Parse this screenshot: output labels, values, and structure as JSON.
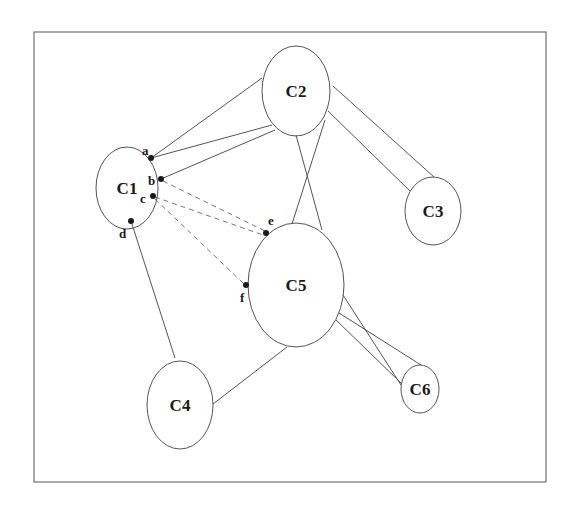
{
  "diagram": {
    "frame": {
      "x": 34,
      "y": 32,
      "width": 512,
      "height": 450
    },
    "colors": {
      "stroke": "#555555",
      "text": "#1a1a1a",
      "dashed": "#777777",
      "background": "#ffffff"
    },
    "nodes": [
      {
        "id": "C1",
        "label": "C1",
        "cx": 127,
        "cy": 188,
        "rx": 31,
        "ry": 41
      },
      {
        "id": "C2",
        "label": "C2",
        "cx": 296,
        "cy": 91,
        "rx": 34,
        "ry": 45
      },
      {
        "id": "C3",
        "label": "C3",
        "cx": 433,
        "cy": 211,
        "rx": 28,
        "ry": 34
      },
      {
        "id": "C4",
        "label": "C4",
        "cx": 180,
        "cy": 405,
        "rx": 33,
        "ry": 44
      },
      {
        "id": "C5",
        "label": "C5",
        "cx": 296,
        "cy": 285,
        "rx": 48,
        "ry": 62
      },
      {
        "id": "C6",
        "label": "C6",
        "cx": 420,
        "cy": 389,
        "rx": 19,
        "ry": 24
      }
    ],
    "points": [
      {
        "id": "a",
        "label": "a",
        "x": 151,
        "y": 158,
        "lx": 142,
        "ly": 155
      },
      {
        "id": "b",
        "label": "b",
        "x": 161,
        "y": 179,
        "lx": 148,
        "ly": 185
      },
      {
        "id": "c",
        "label": "c",
        "x": 153,
        "y": 196,
        "lx": 140,
        "ly": 203
      },
      {
        "id": "d",
        "label": "d",
        "x": 131,
        "y": 221,
        "lx": 119,
        "ly": 238
      },
      {
        "id": "e",
        "label": "e",
        "x": 266,
        "y": 233,
        "lx": 268,
        "ly": 225
      },
      {
        "id": "f",
        "label": "f",
        "x": 246,
        "y": 285,
        "lx": 240,
        "ly": 302
      }
    ],
    "edges": [
      {
        "from": "a",
        "x1": 151,
        "y1": 158,
        "x2": 262,
        "y2": 78,
        "style": "solid"
      },
      {
        "from": "a",
        "x1": 151,
        "y1": 158,
        "x2": 272,
        "y2": 125,
        "style": "solid"
      },
      {
        "from": "b",
        "x1": 161,
        "y1": 179,
        "x2": 275,
        "y2": 130,
        "style": "solid"
      },
      {
        "from": "C2",
        "x1": 333,
        "y1": 86,
        "x2": 434,
        "y2": 177,
        "style": "solid"
      },
      {
        "from": "C2",
        "x1": 328,
        "y1": 111,
        "x2": 410,
        "y2": 191,
        "style": "solid"
      },
      {
        "from": "C2",
        "x1": 296,
        "y1": 135,
        "x2": 322,
        "y2": 230,
        "style": "solid"
      },
      {
        "from": "C2",
        "x1": 325,
        "y1": 120,
        "x2": 292,
        "y2": 224,
        "style": "solid"
      },
      {
        "from": "d",
        "x1": 131,
        "y1": 221,
        "x2": 175,
        "y2": 358,
        "style": "solid"
      },
      {
        "from": "C4",
        "x1": 213,
        "y1": 404,
        "x2": 287,
        "y2": 347,
        "style": "solid"
      },
      {
        "from": "C5",
        "x1": 343,
        "y1": 295,
        "x2": 401,
        "y2": 385,
        "style": "solid"
      },
      {
        "from": "C5",
        "x1": 339,
        "y1": 313,
        "x2": 421,
        "y2": 365,
        "style": "solid"
      },
      {
        "from": "C5",
        "x1": 336,
        "y1": 320,
        "x2": 402,
        "y2": 384,
        "style": "solid"
      },
      {
        "from": "b",
        "x1": 163,
        "y1": 181,
        "x2": 265,
        "y2": 231,
        "style": "dashed"
      },
      {
        "from": "c",
        "x1": 155,
        "y1": 197,
        "x2": 263,
        "y2": 235,
        "style": "dashed"
      },
      {
        "from": "c",
        "x1": 155,
        "y1": 199,
        "x2": 244,
        "y2": 284,
        "style": "dashed"
      }
    ]
  }
}
